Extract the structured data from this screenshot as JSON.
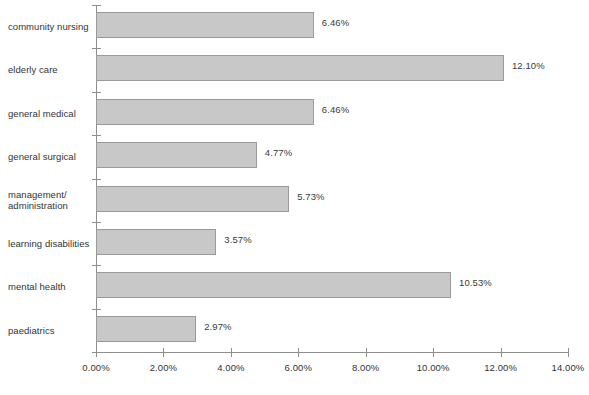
{
  "chart_data": {
    "type": "bar",
    "orientation": "horizontal",
    "title": "",
    "xlabel": "",
    "ylabel": "",
    "xlim": [
      0,
      14
    ],
    "grid": false,
    "legend": null,
    "categories": [
      "community nursing",
      "elderly care",
      "general medical",
      "general surgical",
      "management/\nadministration",
      "learning disabilities",
      "mental health",
      "paediatrics"
    ],
    "values": [
      6.46,
      12.1,
      6.46,
      4.77,
      5.73,
      3.57,
      10.53,
      2.97
    ],
    "value_labels": [
      "6.46%",
      "12.10%",
      "6.46%",
      "4.77%",
      "5.73%",
      "3.57%",
      "10.53%",
      "2.97%"
    ],
    "x_ticks": [
      0,
      2,
      4,
      6,
      8,
      10,
      12,
      14
    ],
    "x_tick_labels": [
      "0.00%",
      "2.00%",
      "4.00%",
      "6.00%",
      "8.00%",
      "10.00%",
      "12.00%",
      "14.00%"
    ],
    "colors": {
      "bar_fill": "#c8c8c8",
      "bar_border": "#9a9a9a",
      "axis": "#8d8d8d",
      "text": "#333333",
      "background": "#ffffff"
    }
  }
}
